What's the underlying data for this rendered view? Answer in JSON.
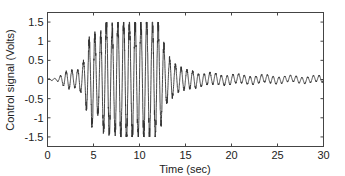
{
  "chart_data": {
    "type": "line",
    "title": "",
    "xlabel": "Time (sec)",
    "ylabel": "Control signal (Volts)",
    "xlim": [
      0,
      30
    ],
    "ylim": [
      -1.75,
      1.75
    ],
    "xticks": [
      0,
      5,
      10,
      15,
      20,
      25,
      30
    ],
    "xtick_labels": [
      "0",
      "5",
      "10",
      "15",
      "20",
      "25",
      "30"
    ],
    "yticks": [
      -1.5,
      -1,
      -0.5,
      0,
      0.5,
      1,
      1.5
    ],
    "ytick_labels": [
      "-1.5",
      "-1",
      "-0.5",
      "0",
      "0.5",
      "1",
      "1.5"
    ],
    "grid": false,
    "legend": null,
    "series": [
      {
        "name": "Control signal",
        "color": "#333333",
        "description": "Oscillatory control signal; near zero until ~2 s, small oscillations 2-4 s, growing to ~1.2-1.5 peaks 4-7 s, saturating at ±1.5 V from ~7.5-12 s, decaying ~12-15 s, then small oscillations (~±0.1 V) through 30 s",
        "envelope": {
          "t": [
            0,
            1,
            2,
            2.5,
            3,
            3.5,
            4,
            4.5,
            5,
            5.5,
            6,
            6.5,
            7,
            7.5,
            8,
            9,
            10,
            11,
            12,
            12.5,
            13,
            14,
            15,
            16,
            17,
            18,
            19,
            20,
            22,
            24,
            26,
            28,
            30
          ],
          "amp": [
            0.02,
            0.03,
            0.2,
            0.25,
            0.2,
            0.3,
            0.5,
            1.0,
            1.25,
            0.9,
            1.3,
            1.5,
            1.3,
            1.5,
            1.5,
            1.5,
            1.5,
            1.5,
            1.5,
            1.0,
            0.6,
            0.35,
            0.25,
            0.2,
            0.15,
            0.15,
            0.12,
            0.12,
            0.1,
            0.1,
            0.08,
            0.08,
            0.08
          ]
        },
        "frequency_hz": 1.6
      }
    ]
  }
}
